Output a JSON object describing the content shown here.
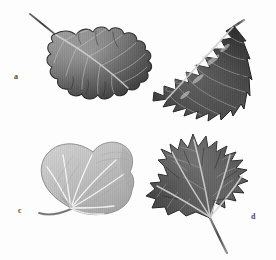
{
  "plate": {
    "kind": "botanical-illustration-plate",
    "medium": "grayscale pencil drawing",
    "background_color": "#fdfdfd",
    "width": 276,
    "height": 260,
    "panel_count": 4,
    "layout": "2x2 grid of leaf specimens, each with a lowercase letter label"
  },
  "labels": {
    "a": "a",
    "b": "b",
    "c": "c",
    "d": "d"
  },
  "figures": [
    {
      "key": "a",
      "label": "a",
      "name": "oak-leaf",
      "common_name": "Oak leaf",
      "margin": "lobed with rounded lobes and deep sinuses",
      "venation": "pinnate",
      "shape": "obovate, pinnately lobed",
      "position": "top-left",
      "orientation": "tip lower-right, petiole upper-left",
      "tone": "dark gray with hatched shading",
      "colors": {
        "blade_dark": "#4b4b4b",
        "blade_mid": "#6e6e6e",
        "blade_light": "#b9b9b9",
        "outline": "#2f2f2f",
        "midrib": "#d8d8d8"
      },
      "label_position": {
        "x": 14,
        "y": 73
      }
    },
    {
      "key": "b",
      "label": "b",
      "name": "holly-leaf",
      "common_name": "Holly leaf",
      "margin": "spinose-dentate with sharp marginal spines",
      "venation": "pinnate",
      "shape": "elliptic with spiny teeth",
      "position": "top-right",
      "orientation": "tip lower-left, petiole upper-right",
      "tone": "very dark gray, glossy highlights",
      "colors": {
        "blade_dark": "#3a3a3a",
        "blade_mid": "#5e5e5e",
        "blade_light": "#c4c4c4",
        "outline": "#262626",
        "midrib": "#cfcfcf"
      },
      "label_position": {
        "x": 239,
        "y": 73
      }
    },
    {
      "key": "c",
      "label": "c",
      "name": "cordate-leaf",
      "common_name": "Heart-shaped (cordate) leaf",
      "margin": "entire, slightly wavy",
      "venation": "palmate, veins radiating from base",
      "shape": "cordate, broadly heart-shaped",
      "position": "bottom-left",
      "orientation": "petiole to lower-left",
      "tone": "light gray, pale shading",
      "colors": {
        "blade_dark": "#9a9a9a",
        "blade_mid": "#bdbdbd",
        "blade_light": "#e2e2e2",
        "outline": "#8a8a8a",
        "midrib": "#ffffff"
      },
      "label_position": {
        "x": 18,
        "y": 207
      }
    },
    {
      "key": "d",
      "label": "d",
      "name": "maple-leaf",
      "common_name": "Maple leaf",
      "margin": "palmately lobed with pointed lobes and coarse teeth",
      "venation": "palmate, five main veins",
      "shape": "palmate, five-lobed",
      "position": "bottom-right",
      "orientation": "petiole to lower-right",
      "tone": "dark gray with fine vertical hatching",
      "colors": {
        "blade_dark": "#474747",
        "blade_mid": "#6a6a6a",
        "blade_light": "#b5b5b5",
        "outline": "#2b2b2b",
        "midrib": "#d5d5d5"
      },
      "label_position": {
        "x": 251,
        "y": 213
      }
    }
  ]
}
